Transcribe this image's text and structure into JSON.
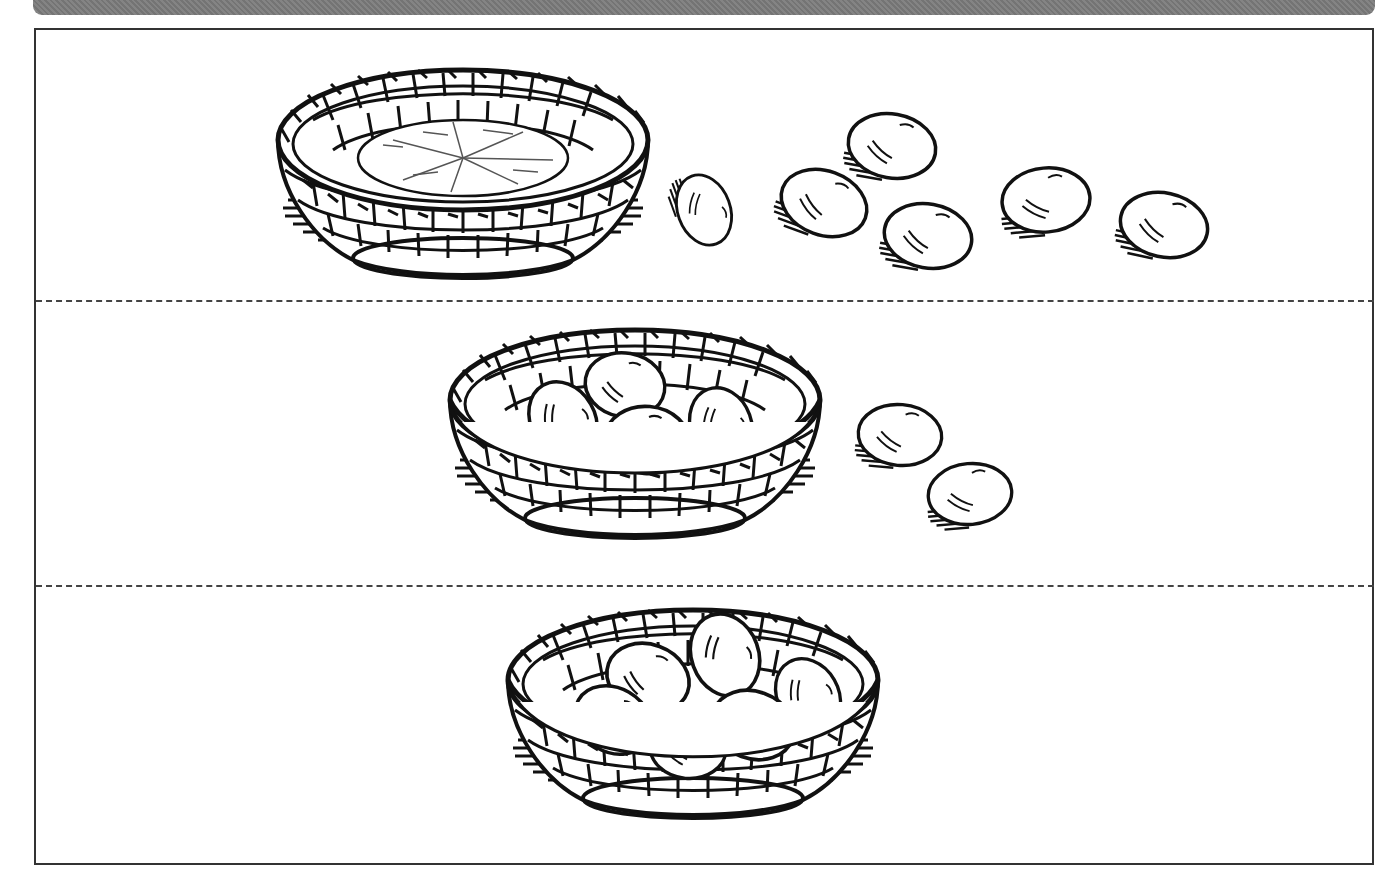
{
  "worksheet": {
    "description": "Eggs and basket counting worksheet",
    "colors": {
      "ink": "#111111",
      "bar": "#7a7a7a",
      "divider": "#444444",
      "background": "#ffffff"
    },
    "rows": [
      {
        "label": "row-1",
        "basket_state": "empty",
        "eggs_in_basket": 0,
        "eggs_outside": 6,
        "total_eggs": 6
      },
      {
        "label": "row-2",
        "basket_state": "partially-filled",
        "eggs_in_basket": 4,
        "eggs_outside": 2,
        "total_eggs": 6
      },
      {
        "label": "row-3",
        "basket_state": "full",
        "eggs_in_basket": 6,
        "eggs_outside": 0,
        "total_eggs": 6
      }
    ]
  }
}
